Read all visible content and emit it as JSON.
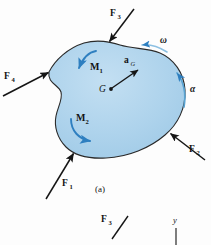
{
  "figure": {
    "caption": "(a)",
    "body_fill": "#aed3ec",
    "body_stroke": "#2a2a2a",
    "arrow_black": "#151515",
    "arrow_blue": "#2e7fc0",
    "background": "#fdfdfd"
  },
  "forces": [
    {
      "name": "F1",
      "base": "F",
      "sub": "1",
      "label_x": 62,
      "label_y": 186
    },
    {
      "name": "F2",
      "base": "F",
      "sub": "2",
      "label_x": 190,
      "label_y": 152
    },
    {
      "name": "F3",
      "base": "F",
      "sub": "3",
      "label_x": 110,
      "label_y": 16
    },
    {
      "name": "F4",
      "base": "F",
      "sub": "4",
      "label_x": 6,
      "label_y": 79
    }
  ],
  "moments": [
    {
      "name": "M1",
      "base": "M",
      "sub": "1",
      "label_x": 93,
      "label_y": 70
    },
    {
      "name": "M2",
      "base": "M",
      "sub": "2",
      "label_x": 80,
      "label_y": 121
    }
  ],
  "kinematics": {
    "omega": {
      "symbol": "ω",
      "label_x": 160,
      "label_y": 43
    },
    "alpha": {
      "symbol": "α",
      "label_x": 190,
      "label_y": 92
    },
    "acceleration": {
      "base": "a",
      "sub": "G",
      "label_x": 126,
      "label_y": 63
    },
    "center_of_mass": {
      "symbol": "G",
      "label_x": 100,
      "label_y": 92
    }
  },
  "second_figure": {
    "force": {
      "base": "F",
      "sub": "3",
      "label_x": 103,
      "label_y": 222
    },
    "axis": {
      "symbol": "y",
      "label_x": 176,
      "label_y": 222
    }
  }
}
